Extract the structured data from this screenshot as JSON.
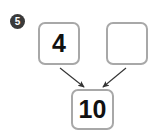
{
  "worksheet": {
    "problem_number": "5",
    "type": "number-bond-addition",
    "boxes": {
      "addend_left": "4",
      "addend_right": "",
      "sum": "10"
    },
    "arrows": [
      {
        "name": "arrow-left-to-sum",
        "from": "addend_left",
        "to": "sum",
        "direction": "down-right"
      },
      {
        "name": "arrow-right-to-sum",
        "from": "addend_right",
        "to": "sum",
        "direction": "down-left"
      }
    ],
    "colors": {
      "box_border": "#a8a8a8",
      "box_fill": "#ffffff",
      "digit": "#111111",
      "marker_fill": "#3a3a3a",
      "marker_text": "#ffffff",
      "arrow": "#333333",
      "page_background": "#ffffff"
    }
  }
}
